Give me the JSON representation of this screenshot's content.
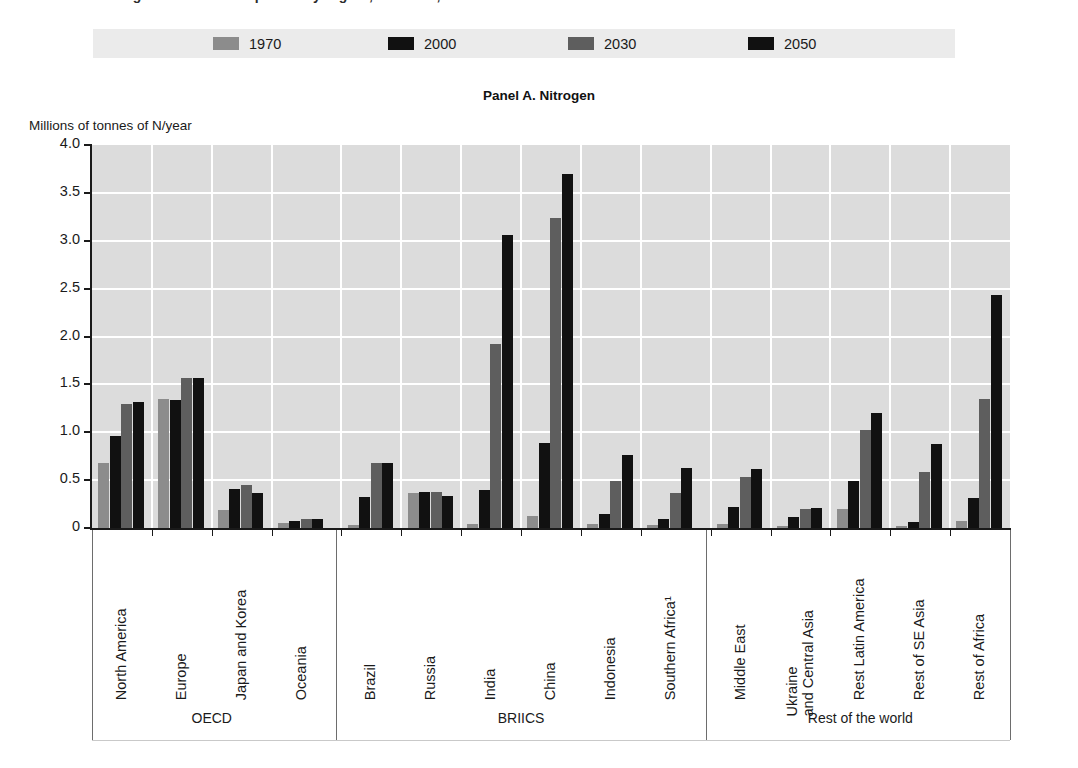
{
  "title_sliver": "Figure: Nutrient surpluses by region, Baseline, 1970-2050",
  "panel_title": "Panel A. Nitrogen",
  "y_axis_title": "Millions of tonnes of N/year",
  "legend": {
    "items": [
      {
        "label": "1970",
        "color": "#8c8c8c"
      },
      {
        "label": "2000",
        "color": "#111111"
      },
      {
        "label": "2030",
        "color": "#5e5e5e"
      },
      {
        "label": "2050",
        "color": "#111111"
      }
    ],
    "background": "#ebebeb"
  },
  "groups": [
    {
      "name": "OECD",
      "count": 4
    },
    {
      "name": "BRIICS",
      "count": 6
    },
    {
      "name": "Rest of the world",
      "count": 5
    }
  ],
  "chart_data": {
    "type": "bar",
    "title": "Panel A. Nitrogen",
    "xlabel": "",
    "ylabel": "Millions of tonnes of N/year",
    "ylim": [
      0,
      4.0
    ],
    "yticks": [
      0,
      0.5,
      1.0,
      1.5,
      2.0,
      2.5,
      3.0,
      3.5,
      4.0
    ],
    "ytick_labels": [
      "0",
      "0.5",
      "1.0",
      "1.5",
      "2.0",
      "2.5",
      "3.0",
      "3.5",
      "4.0"
    ],
    "grid": true,
    "legend_position": "top",
    "categories": [
      "North America",
      "Europe",
      "Japan and Korea",
      "Oceania",
      "Brazil",
      "Russia",
      "India",
      "China",
      "Indonesia",
      "Southern Africa¹",
      "Middle East",
      "Ukraine and Central Asia",
      "Rest Latin America",
      "Rest of SE Asia",
      "Rest of Africa"
    ],
    "category_lines": [
      [
        "North America"
      ],
      [
        "Europe"
      ],
      [
        "Japan and Korea"
      ],
      [
        "Oceania"
      ],
      [
        "Brazil"
      ],
      [
        "Russia"
      ],
      [
        "India"
      ],
      [
        "China"
      ],
      [
        "Indonesia"
      ],
      [
        "Southern Africa¹"
      ],
      [
        "Middle East"
      ],
      [
        "Ukraine",
        "and Central Asia"
      ],
      [
        "Rest Latin America"
      ],
      [
        "Rest of SE Asia"
      ],
      [
        "Rest of Africa"
      ]
    ],
    "series": [
      {
        "name": "1970",
        "color": "#8c8c8c",
        "values": [
          0.68,
          1.35,
          0.19,
          0.05,
          0.03,
          0.37,
          0.04,
          0.13,
          0.04,
          0.03,
          0.04,
          0.02,
          0.2,
          0.02,
          0.07
        ]
      },
      {
        "name": "2000",
        "color": "#111111",
        "values": [
          0.96,
          1.34,
          0.41,
          0.07,
          0.32,
          0.38,
          0.4,
          0.89,
          0.15,
          0.09,
          0.22,
          0.12,
          0.49,
          0.06,
          0.31
        ]
      },
      {
        "name": "2030",
        "color": "#5e5e5e",
        "values": [
          1.3,
          1.57,
          0.45,
          0.09,
          0.68,
          0.38,
          1.92,
          3.24,
          0.49,
          0.37,
          0.53,
          0.2,
          1.02,
          0.58,
          1.35
        ]
      },
      {
        "name": "2050",
        "color": "#111111",
        "values": [
          1.32,
          1.57,
          0.37,
          0.09,
          0.68,
          0.33,
          3.06,
          3.7,
          0.76,
          0.63,
          0.62,
          0.21,
          1.2,
          0.88,
          2.43
        ]
      }
    ]
  }
}
